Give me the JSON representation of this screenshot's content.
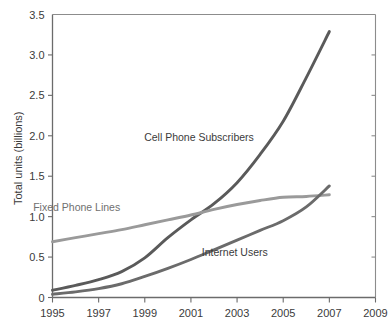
{
  "chart_data": {
    "type": "line",
    "title": "",
    "xlabel": "",
    "ylabel": "Total units (billions)",
    "xlim": [
      1995,
      2009
    ],
    "ylim": [
      0,
      3.5
    ],
    "grid": false,
    "legend_position": "inline-annotations",
    "x_ticks": [
      "1995",
      "1997",
      "1999",
      "2001",
      "2003",
      "2005",
      "2007",
      "2009"
    ],
    "y_ticks": [
      "0",
      "0.5",
      "1.0",
      "1.5",
      "2.0",
      "2.5",
      "3.0",
      "3.5"
    ],
    "x": [
      1995,
      1996,
      1997,
      1998,
      1999,
      2000,
      2001,
      2002,
      2003,
      2004,
      2005,
      2006,
      2007
    ],
    "series": [
      {
        "name": "Cell Phone Subscribers",
        "color": "#5a5a5a",
        "label_x": 2001.35,
        "label_y": 1.93,
        "values": [
          0.09,
          0.15,
          0.22,
          0.32,
          0.49,
          0.74,
          0.96,
          1.16,
          1.42,
          1.77,
          2.18,
          2.72,
          3.29
        ]
      },
      {
        "name": "Fixed Phone Lines",
        "color": "#9a9a9a",
        "label_x": 1996.05,
        "label_y": 1.07,
        "values": [
          0.69,
          0.74,
          0.79,
          0.84,
          0.9,
          0.96,
          1.02,
          1.09,
          1.15,
          1.2,
          1.24,
          1.25,
          1.27
        ]
      },
      {
        "name": "Internet Users",
        "color": "#6b6b6b",
        "label_x": 2002.9,
        "label_y": 0.52,
        "values": [
          0.04,
          0.07,
          0.11,
          0.17,
          0.26,
          0.36,
          0.47,
          0.59,
          0.71,
          0.83,
          0.95,
          1.12,
          1.38
        ]
      }
    ],
    "axis_color": "#6b6b6b",
    "frame_color": "#8c8c8c",
    "text_color": "#3b3b3b",
    "background": "#ffffff"
  }
}
